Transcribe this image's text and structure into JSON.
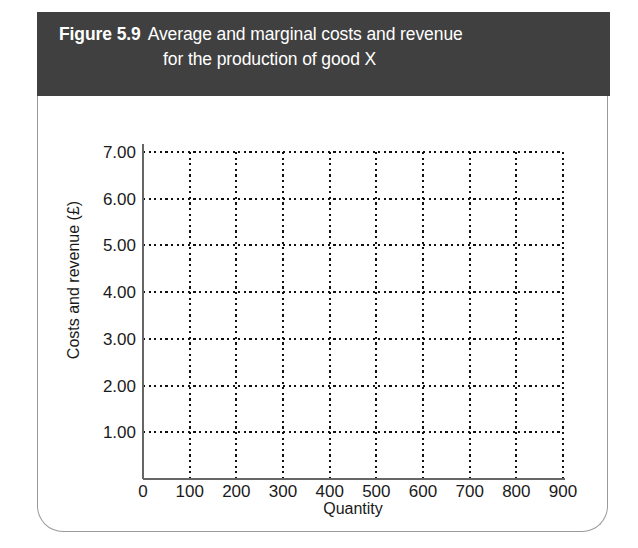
{
  "figure": {
    "label": "Figure 5.9",
    "caption_line_1": "Average and marginal costs and revenue",
    "caption_line_2": "for the production of good X",
    "header_bg": "#404040",
    "header_text_color": "#ffffff",
    "card_border_color": "#9a9a9a",
    "card_bg": "#ffffff"
  },
  "chart_data": {
    "type": "line",
    "title": "",
    "xlabel": "Quantity",
    "ylabel": "Costs and revenue (£)",
    "xlim": [
      0,
      900
    ],
    "ylim": [
      0,
      7.5
    ],
    "x_ticks": [
      0,
      100,
      200,
      300,
      400,
      500,
      600,
      700,
      800,
      900
    ],
    "x_tick_labels": [
      "0",
      "100",
      "200",
      "300",
      "400",
      "500",
      "600",
      "700",
      "800",
      "900"
    ],
    "y_ticks": [
      1,
      2,
      3,
      4,
      5,
      6,
      7
    ],
    "y_tick_labels": [
      "1.00",
      "2.00",
      "3.00",
      "4.00",
      "5.00",
      "6.00",
      "7.00"
    ],
    "grid": true,
    "grid_style": "dotted",
    "grid_color": "#111111",
    "axis_color": "#666666",
    "legend": null,
    "series": [],
    "note": "Blank plotting grid — no data series are drawn; the figure is an empty template for the reader to plot average and marginal cost and revenue curves."
  },
  "geometry": {
    "plot_left": 105,
    "plot_right": 525,
    "plot_top": 56,
    "plot_bottom": 383,
    "y_top_value": 7,
    "y_bottom_value": 0
  }
}
